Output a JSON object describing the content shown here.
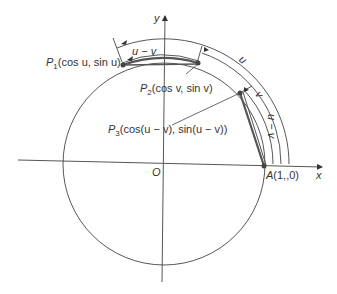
{
  "diagram": {
    "type": "unit-circle",
    "axes": {
      "x_label": "x",
      "y_label": "y",
      "origin_label": "O"
    },
    "points": {
      "p1": {
        "name": "P",
        "sub": "1",
        "coords": "(cos u, sin u)"
      },
      "p2": {
        "name": "P",
        "sub": "2",
        "coords": "(cos v, sin v)"
      },
      "p3": {
        "name": "P",
        "sub": "3",
        "coords": "(cos(u − v), sin(u − v))"
      },
      "a": {
        "name": "A",
        "coords": "(1,,0)"
      }
    },
    "arc_labels": {
      "u": "u",
      "v": "v",
      "u_minus_v_top": "u − v",
      "u_minus_v_right": "u − v"
    },
    "colors": {
      "line": "#333333",
      "chord": "#555555",
      "point": "#444444"
    }
  }
}
